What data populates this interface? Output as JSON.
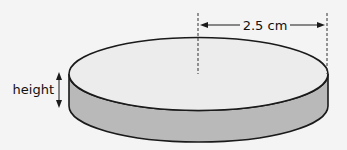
{
  "diagram": {
    "type": "cylinder-disc",
    "radius_label": "2.5 cm",
    "height_label": "height",
    "colors": {
      "background": "#f4f4f4",
      "top_face": "#ececec",
      "side_face": "#b9b9b9",
      "outline": "#1a1a1a"
    }
  }
}
